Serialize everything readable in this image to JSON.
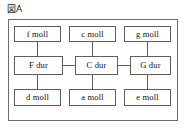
{
  "figure": {
    "label": "図A",
    "frame_color": "#6b6b6b",
    "box_border_color": "#5e5e5e",
    "background_color": "#ffffff",
    "text_color": "#111111"
  },
  "diagram": {
    "type": "grid-relationship-diagram",
    "rows": 3,
    "columns": 3,
    "row_labels": [
      "upper-minor",
      "major",
      "lower-minor"
    ],
    "column_labels": [
      "subdominant",
      "tonic",
      "dominant"
    ],
    "nodes": [
      {
        "id": "f-moll",
        "label": "f moll",
        "row": 0,
        "col": 0,
        "kind": "minor"
      },
      {
        "id": "c-moll",
        "label": "c moll",
        "row": 0,
        "col": 1,
        "kind": "minor"
      },
      {
        "id": "g-moll",
        "label": "g moll",
        "row": 0,
        "col": 2,
        "kind": "minor"
      },
      {
        "id": "f-dur",
        "label": "F dur",
        "row": 1,
        "col": 0,
        "kind": "major"
      },
      {
        "id": "c-dur",
        "label": "C dur",
        "row": 1,
        "col": 1,
        "kind": "major"
      },
      {
        "id": "g-dur",
        "label": "G dur",
        "row": 1,
        "col": 2,
        "kind": "major"
      },
      {
        "id": "d-moll",
        "label": "d moll",
        "row": 2,
        "col": 0,
        "kind": "minor"
      },
      {
        "id": "a-moll",
        "label": "a moll",
        "row": 2,
        "col": 1,
        "kind": "minor"
      },
      {
        "id": "e-moll",
        "label": "e moll",
        "row": 2,
        "col": 2,
        "kind": "minor"
      }
    ],
    "edges": [
      {
        "from": "f-moll",
        "to": "f-dur",
        "orientation": "vertical"
      },
      {
        "from": "c-moll",
        "to": "c-dur",
        "orientation": "vertical"
      },
      {
        "from": "g-moll",
        "to": "g-dur",
        "orientation": "vertical"
      },
      {
        "from": "f-dur",
        "to": "d-moll",
        "orientation": "vertical"
      },
      {
        "from": "c-dur",
        "to": "a-moll",
        "orientation": "vertical"
      },
      {
        "from": "g-dur",
        "to": "e-moll",
        "orientation": "vertical"
      },
      {
        "from": "f-dur",
        "to": "c-dur",
        "orientation": "horizontal"
      },
      {
        "from": "c-dur",
        "to": "g-dur",
        "orientation": "horizontal"
      }
    ]
  }
}
